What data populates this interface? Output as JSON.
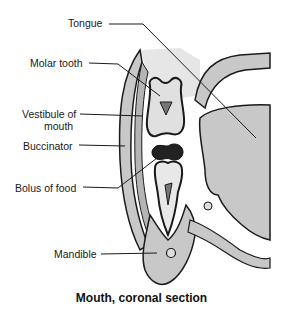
{
  "labels": {
    "tongue": "Tongue",
    "molar_tooth": "Molar tooth",
    "vestibule_line1": "Vestibule of",
    "vestibule_line2": "mouth",
    "buccinator": "Buccinator",
    "bolus": "Bolus of food",
    "mandible": "Mandible"
  },
  "caption": "Mouth, coronal section",
  "colors": {
    "outline": "#1a1a1a",
    "tissue_gray": "#c8c8c8",
    "light_gray": "#e2e2e2",
    "bolus": "#222222",
    "background": "#ffffff"
  }
}
